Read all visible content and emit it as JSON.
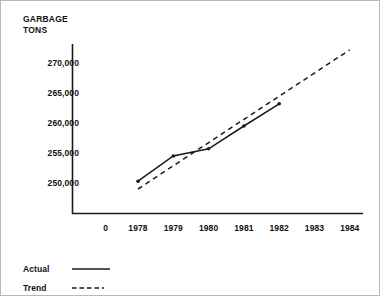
{
  "chart_data": {
    "type": "line",
    "title": "",
    "ylabel_line1": "GARBAGE",
    "ylabel_line2": "TONS",
    "xlabel": "",
    "x_ticks": [
      "0",
      "1978",
      "1979",
      "1980",
      "1981",
      "1982",
      "1983",
      "1984"
    ],
    "y_ticks": [
      "250,000",
      "255,000",
      "260,000",
      "265,000",
      "270,000"
    ],
    "y_tick_values": [
      250000,
      255000,
      260000,
      265000,
      270000
    ],
    "ylim": [
      246500,
      273500
    ],
    "xlim_years": [
      1977,
      1984
    ],
    "grid": false,
    "legend_position": "below-plot-left",
    "categories": [
      1978,
      1979,
      1980,
      1981,
      1982,
      1983,
      1984
    ],
    "series": [
      {
        "name": "Actual",
        "style": "solid",
        "color": "#1a1a1a",
        "markers": true,
        "x": [
          1978,
          1979,
          1980,
          1981,
          1982
        ],
        "values": [
          250300,
          254500,
          255700,
          259500,
          263200
        ]
      },
      {
        "name": "Trend",
        "style": "dashed",
        "color": "#1a1a1a",
        "markers": false,
        "x": [
          1978,
          1984
        ],
        "values": [
          249000,
          272200
        ]
      }
    ]
  },
  "legend": {
    "items": [
      {
        "label": "Actual",
        "style": "solid"
      },
      {
        "label": "Trend",
        "style": "dashed"
      }
    ]
  },
  "colors": {
    "line": "#1a1a1a",
    "axis": "#1a1a1a",
    "text": "#111111",
    "background": "#ffffff",
    "border": "#b9b9b9"
  }
}
